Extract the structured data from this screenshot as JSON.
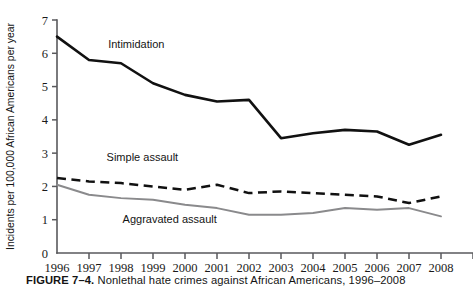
{
  "caption": {
    "figure_number": "FIGURE 7–4.",
    "text": "Nonlethal hate crimes against African Americans, 1996–2008"
  },
  "chart_data": {
    "type": "line",
    "title": "",
    "xlabel": "",
    "ylabel": "Incidents per 100,000 African Americans per year",
    "x": [
      1996,
      1997,
      1998,
      1999,
      2000,
      2001,
      2002,
      2003,
      2004,
      2005,
      2006,
      2007,
      2008
    ],
    "categories": [
      "1996",
      "1997",
      "1998",
      "1999",
      "2000",
      "2001",
      "2002",
      "2003",
      "2004",
      "2005",
      "2006",
      "2007",
      "2008"
    ],
    "xlim": [
      1996,
      2008
    ],
    "ylim": [
      0,
      7
    ],
    "yticks": [
      0,
      1,
      2,
      3,
      4,
      5,
      6,
      7
    ],
    "ytick_labels": [
      "0",
      "1",
      "2",
      "3",
      "4",
      "5",
      "6",
      "7"
    ],
    "grid": false,
    "legend_position": "inline-labels",
    "series": [
      {
        "name": "Intimidation",
        "style": "solid",
        "color": "#111111",
        "values": [
          6.5,
          5.8,
          5.7,
          5.1,
          4.75,
          4.55,
          4.6,
          3.45,
          3.6,
          3.7,
          3.65,
          3.25,
          3.55
        ],
        "label_x": 1997.6,
        "label_y": 6.15
      },
      {
        "name": "Simple assault",
        "style": "dashed",
        "color": "#111111",
        "values": [
          2.25,
          2.15,
          2.1,
          2.0,
          1.9,
          2.05,
          1.8,
          1.85,
          1.8,
          1.75,
          1.7,
          1.5,
          1.7
        ],
        "label_x": 1997.55,
        "label_y": 2.75
      },
      {
        "name": "Aggravated assault",
        "style": "solid",
        "color": "#8a8a8c",
        "values": [
          2.05,
          1.75,
          1.65,
          1.6,
          1.45,
          1.35,
          1.15,
          1.15,
          1.2,
          1.35,
          1.3,
          1.35,
          1.1
        ],
        "label_x": 1998.05,
        "label_y": 0.9
      }
    ]
  }
}
